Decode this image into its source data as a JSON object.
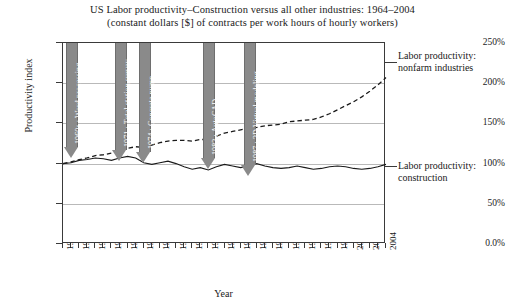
{
  "chart": {
    "title_line1": "US Labor productivity–Construction versus all other industries: 1964–2004",
    "title_line2": "(constant dollars [$] of contracts per work hours of hourly workers)",
    "y_axis_title": "Productivity index",
    "x_axis_title": "Year"
  },
  "y_ticks": [
    "250%",
    "200%",
    "150%",
    "100%",
    "50%",
    "0.0%"
  ],
  "x_ticks": [
    "1964",
    "1966",
    "1968",
    "1970",
    "1972",
    "1974",
    "1976",
    "1978",
    "1980",
    "1982",
    "1984",
    "1986",
    "1988",
    "1990",
    "1992",
    "1994",
    "1996",
    "1998",
    "2000",
    "2002",
    "2004"
  ],
  "annotations": [
    {
      "label": "1960s : Word processing",
      "year": 1965
    },
    {
      "label": "1971 : Total station survey",
      "year": 1971
    },
    {
      "label": "1974 : Concrete pump",
      "year": 1974
    },
    {
      "label": "1982 : AutoCAD",
      "year": 1982
    },
    {
      "label": "1987 : 3D Virtual modeling",
      "year": 1987
    }
  ],
  "side_labels": {
    "nonfarm_line1": "Labor productivity:",
    "nonfarm_line2": "nonfarm industries",
    "construction_line1": "Labor productivity:",
    "construction_line2": "construction"
  },
  "colors": {
    "arrow_fill": "#8a8a8a",
    "arrow_text": "#ffffff",
    "line": "#1a1a1a",
    "gridline": "#b9b9b9",
    "frame": "#3a3a3a"
  },
  "chart_data": {
    "type": "line",
    "title": "US Labor productivity–Construction versus all other industries: 1964–2004 (constant dollars [$] of contracts per work hours of hourly workers)",
    "xlabel": "Year",
    "ylabel": "Productivity index",
    "xlim": [
      1964,
      2004
    ],
    "ylim": [
      0,
      250
    ],
    "yticks": [
      0,
      50,
      100,
      150,
      200,
      250
    ],
    "ytick_labels": [
      "0.0%",
      "50%",
      "100%",
      "150%",
      "200%",
      "250%"
    ],
    "grid": true,
    "legend": "right-side inline labels",
    "x": [
      1964,
      1965,
      1966,
      1967,
      1968,
      1969,
      1970,
      1971,
      1972,
      1973,
      1974,
      1975,
      1976,
      1977,
      1978,
      1979,
      1980,
      1981,
      1982,
      1983,
      1984,
      1985,
      1986,
      1987,
      1988,
      1989,
      1990,
      1991,
      1992,
      1993,
      1994,
      1995,
      1996,
      1997,
      1998,
      1999,
      2000,
      2001,
      2002,
      2003,
      2004
    ],
    "series": [
      {
        "name": "Labor productivity: construction",
        "style": "solid",
        "values": [
          100,
          101,
          104,
          105,
          107,
          106,
          104,
          107,
          109,
          107,
          101,
          99,
          101,
          103,
          100,
          96,
          93,
          95,
          92,
          96,
          99,
          97,
          95,
          97,
          100,
          97,
          95,
          94,
          95,
          97,
          95,
          93,
          94,
          96,
          97,
          96,
          94,
          93,
          94,
          96,
          99
        ]
      },
      {
        "name": "Labor productivity: nonfarm industries",
        "style": "dashed",
        "values": [
          100,
          102,
          105,
          107,
          110,
          111,
          113,
          116,
          119,
          121,
          120,
          123,
          126,
          128,
          129,
          129,
          128,
          130,
          130,
          134,
          138,
          140,
          142,
          144,
          145,
          147,
          148,
          149,
          152,
          153,
          154,
          155,
          158,
          162,
          167,
          172,
          177,
          183,
          190,
          198,
          207
        ]
      }
    ],
    "annotations": [
      {
        "text": "1960s : Word processing",
        "x": 1965
      },
      {
        "text": "1971 : Total station survey",
        "x": 1971
      },
      {
        "text": "1974 : Concrete pump",
        "x": 1974
      },
      {
        "text": "1982 : AutoCAD",
        "x": 1982
      },
      {
        "text": "1987 : 3D Virtual modeling",
        "x": 1987
      }
    ]
  }
}
